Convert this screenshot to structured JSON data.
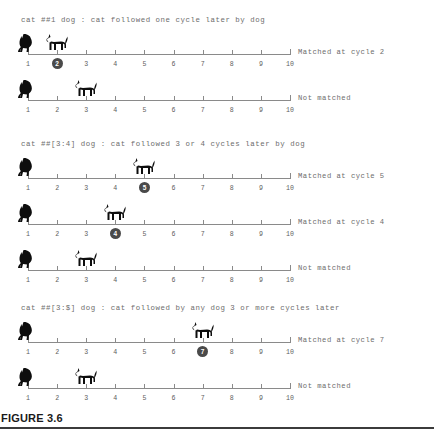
{
  "figure": {
    "label": "FIGURE 3.6"
  },
  "axis": {
    "tick_labels": [
      "1",
      "2",
      "3",
      "4",
      "5",
      "6",
      "7",
      "8",
      "9",
      "10"
    ],
    "min": 1,
    "max": 10
  },
  "icons": {
    "cat": "cat-icon",
    "dog": "dog-icon"
  },
  "colors": {
    "axis": "#8a8a8a",
    "text": "#6d6d6d",
    "marker_fill": "#4a4a4a",
    "marker_text": "#ffffff",
    "animal": "#0d0d0d",
    "rule": "#3b3b3b"
  },
  "sections": [
    {
      "id": "seq-one-cycle",
      "header": "cat ##1 dog : cat followed one cycle later by dog",
      "rows": [
        {
          "id": "row-1-1",
          "cat_cycle": 1,
          "dog_cycle": 2,
          "marker_cycle": 2,
          "marker_label": "2",
          "status": "Matched at cycle 2"
        },
        {
          "id": "row-1-2",
          "cat_cycle": 1,
          "dog_cycle": 3,
          "marker_cycle": null,
          "marker_label": "",
          "status": "Not matched"
        }
      ]
    },
    {
      "id": "seq-three-or-four",
      "header": "cat ##[3:4] dog : cat followed 3 or 4 cycles later by dog",
      "rows": [
        {
          "id": "row-2-1",
          "cat_cycle": 1,
          "dog_cycle": 5,
          "marker_cycle": 5,
          "marker_label": "5",
          "status": "Matched at cycle 5"
        },
        {
          "id": "row-2-2",
          "cat_cycle": 1,
          "dog_cycle": 4,
          "marker_cycle": 4,
          "marker_label": "4",
          "status": "Matched at cycle 4"
        },
        {
          "id": "row-2-3",
          "cat_cycle": 1,
          "dog_cycle": 3,
          "marker_cycle": null,
          "marker_label": "",
          "status": "Not matched"
        }
      ]
    },
    {
      "id": "seq-three-or-more",
      "header": "cat ##[3:$] dog : cat followed by any dog 3 or more cycles later",
      "rows": [
        {
          "id": "row-3-1",
          "cat_cycle": 1,
          "dog_cycle": 7,
          "marker_cycle": 7,
          "marker_label": "7",
          "status": "Matched at cycle 7"
        },
        {
          "id": "row-3-2",
          "cat_cycle": 1,
          "dog_cycle": 3,
          "marker_cycle": null,
          "marker_label": "",
          "status": "Not matched"
        }
      ]
    }
  ]
}
